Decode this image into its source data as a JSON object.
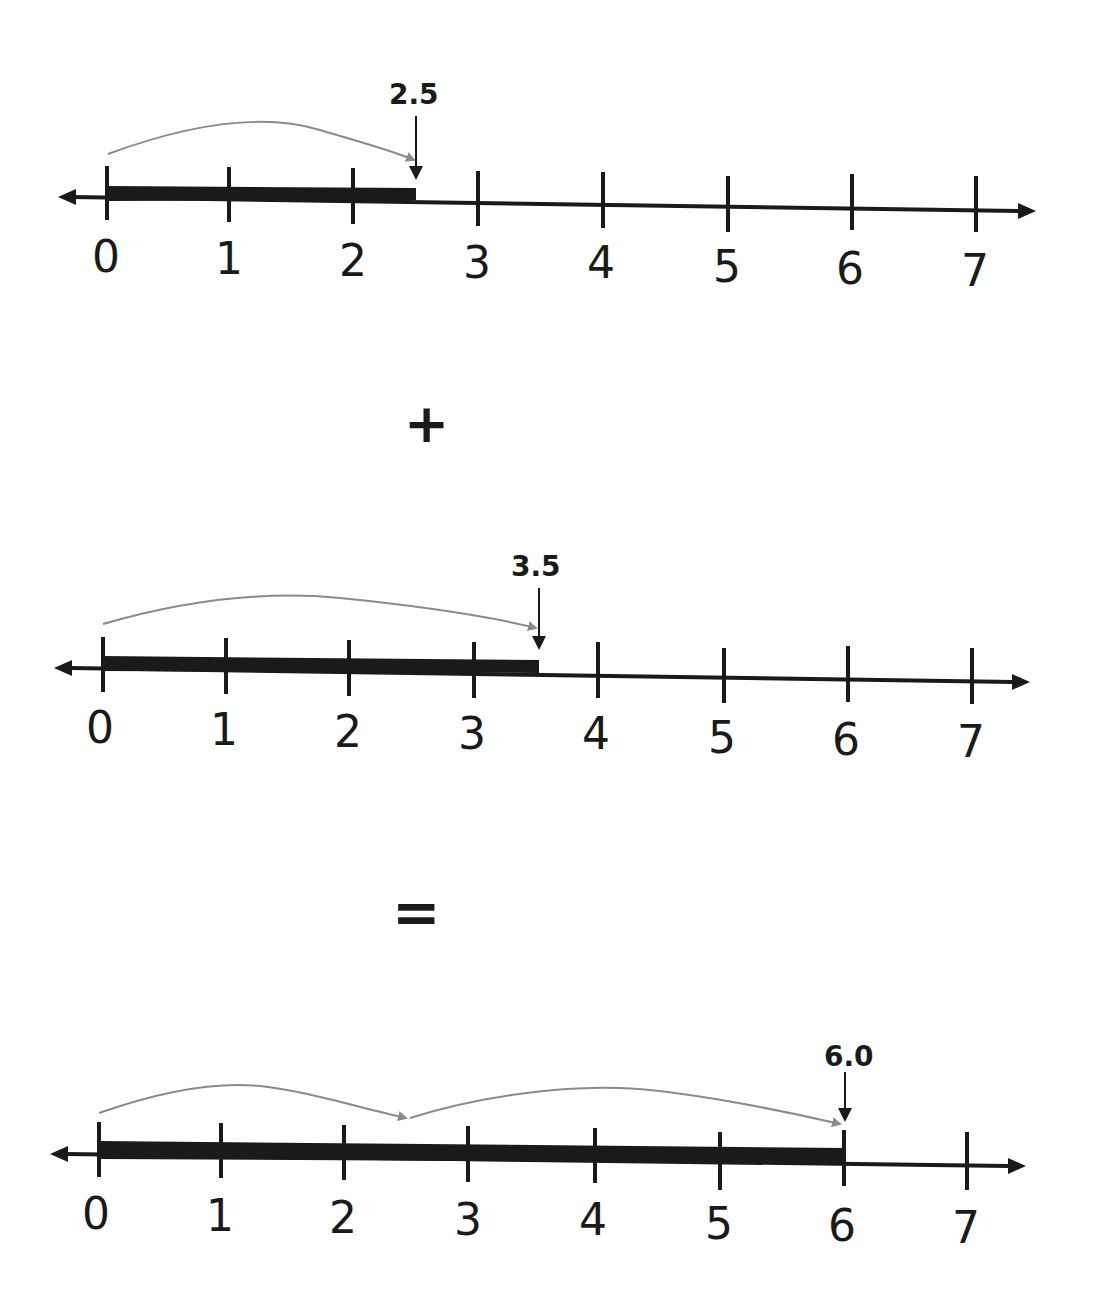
{
  "operators": {
    "plus": "+",
    "equals": "="
  },
  "colors": {
    "line": "#1a1a1a",
    "bar": "#1a1a1a",
    "jump_arrow": "#8a8a8a",
    "background": "#ffffff"
  },
  "number_lines": [
    {
      "id": "first-addend",
      "tick_labels": [
        "0",
        "1",
        "2",
        "3",
        "4",
        "5",
        "6",
        "7"
      ],
      "bar_start": 0,
      "bar_end": 2.5,
      "marker_label": "2.5",
      "jumps": [
        {
          "from": 0,
          "to": 2.5
        }
      ]
    },
    {
      "id": "second-addend",
      "tick_labels": [
        "0",
        "1",
        "2",
        "3",
        "4",
        "5",
        "6",
        "7"
      ],
      "bar_start": 0,
      "bar_end": 3.5,
      "marker_label": "3.5",
      "jumps": [
        {
          "from": 0,
          "to": 3.5
        }
      ]
    },
    {
      "id": "sum",
      "tick_labels": [
        "0",
        "1",
        "2",
        "3",
        "4",
        "5",
        "6",
        "7"
      ],
      "bar_start": 0,
      "bar_end": 6.0,
      "marker_label": "6.0",
      "jumps": [
        {
          "from": 0,
          "to": 2.5
        },
        {
          "from": 2.5,
          "to": 6.0
        }
      ]
    }
  ]
}
